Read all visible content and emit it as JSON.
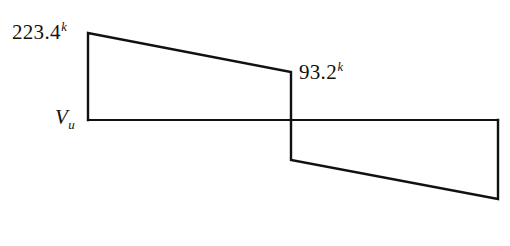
{
  "figure": {
    "kind": "shear-force-diagram",
    "background_color": "#ffffff",
    "line_color": "#111111",
    "line_width": 2.2,
    "width": 510,
    "height": 246
  },
  "labels": {
    "axis": {
      "symbol": "V",
      "subscript": "u",
      "name": "shear-force-axis-label"
    },
    "peak_left": {
      "value": "223.4",
      "unit_superscript": "k"
    },
    "peak_mid": {
      "value": "93.2",
      "unit_superscript": "k"
    }
  },
  "chart_data": {
    "type": "line",
    "title": "",
    "subtitle": "",
    "xlabel": "",
    "ylabel": "V_u",
    "grid": false,
    "legend": null,
    "annotations": [
      {
        "text": "223.4k",
        "at": "left end, positive peak",
        "x_px": 88,
        "y_px": 33
      },
      {
        "text": "93.2k",
        "at": "midspan, positive side just left of step",
        "x_px": 291,
        "y_px": 72
      }
    ],
    "axis_line": {
      "y_value": 0,
      "x_from_px": 88,
      "x_to_px": 498,
      "y_px": 120
    },
    "series": [
      {
        "name": "Shear force Vu (kips)",
        "closed_outline": true,
        "points_px": [
          {
            "x": 88,
            "y": 120
          },
          {
            "x": 88,
            "y": 33
          },
          {
            "x": 291,
            "y": 72
          },
          {
            "x": 291,
            "y": 160
          },
          {
            "x": 498,
            "y": 199
          },
          {
            "x": 498,
            "y": 120
          }
        ],
        "labeled_values_kips": [
          223.4,
          93.2,
          -93.2,
          -223.4
        ],
        "description": "Positive trapezoid from left support sloping from 223.4k down to 93.2k, vertical drop through zero at midspan, negative trapezoid sloping from -93.2k to -223.4k at right support."
      }
    ]
  }
}
